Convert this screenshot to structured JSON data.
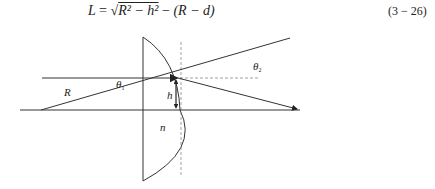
{
  "equation": {
    "text": "L = √(R² − h²) − (R − d)",
    "lhs": "L",
    "eq": "=",
    "sqrt": "√",
    "radicand": "R² − h²",
    "minus": "−",
    "paren": "(R − d)",
    "number": "(3 − 26)"
  },
  "diagram": {
    "labels": {
      "R": "R",
      "theta1": "θ",
      "theta1_sub": "1",
      "theta2": "θ",
      "theta2_sub": "2",
      "h": "h",
      "n": "n"
    },
    "colors": {
      "line": "#333333",
      "dashed": "#888888"
    }
  }
}
